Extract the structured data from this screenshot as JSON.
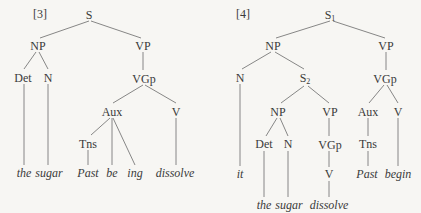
{
  "trees": [
    {
      "number": "[3]",
      "nodes": {
        "S": "S",
        "NP": "NP",
        "VP": "VP",
        "Det": "Det",
        "N": "N",
        "VGp": "VGp",
        "Aux": "Aux",
        "V": "V",
        "Tns": "Tns"
      },
      "words": [
        "the",
        "sugar",
        "Past",
        "be",
        "ing",
        "dissolve"
      ]
    },
    {
      "number": "[4]",
      "nodes": {
        "S1": "S",
        "S1_sub": "1",
        "NP": "NP",
        "VP": "VP",
        "N": "N",
        "S2": "S",
        "S2_sub": "2",
        "VGp": "VGp",
        "NP2": "NP",
        "VP2": "VP",
        "Aux": "Aux",
        "V": "V",
        "Det": "Det",
        "N2": "N",
        "VGp2": "VGp",
        "Tns": "Tns",
        "V2": "V"
      },
      "words": [
        "it",
        "Past",
        "begin",
        "the",
        "sugar",
        "dissolve"
      ]
    }
  ]
}
